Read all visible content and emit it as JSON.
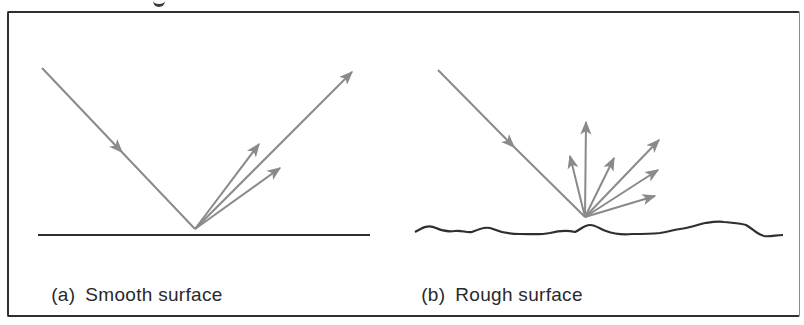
{
  "figure": {
    "panels": [
      {
        "id": "a",
        "label": "(a)",
        "caption": "Smooth surface",
        "surface_type": "smooth",
        "incident_ray": {
          "from": [
            42,
            68
          ],
          "to": [
            195,
            229
          ]
        },
        "reflected_rays": [
          {
            "to": [
              352,
              72
            ],
            "kind": "specular"
          },
          {
            "to": [
              259,
              144
            ],
            "kind": "diffuse"
          },
          {
            "to": [
              280,
              168
            ],
            "kind": "diffuse"
          }
        ]
      },
      {
        "id": "b",
        "label": "(b)",
        "caption": "Rough surface",
        "surface_type": "rough",
        "incident_ray": {
          "from": [
            438,
            70
          ],
          "to": [
            585,
            217
          ]
        },
        "reflected_rays": [
          {
            "to": [
              586,
              122
            ]
          },
          {
            "to": [
              570,
              156
            ]
          },
          {
            "to": [
              614,
              158
            ]
          },
          {
            "to": [
              659,
              140
            ]
          },
          {
            "to": [
              658,
              170
            ]
          },
          {
            "to": [
              655,
              196
            ]
          }
        ]
      }
    ],
    "colors": {
      "ray": "#8a8a8a",
      "surface": "#2f2f2f",
      "frame": "#2f2f2f",
      "text": "#2a2a2a",
      "background": "#ffffff"
    }
  }
}
